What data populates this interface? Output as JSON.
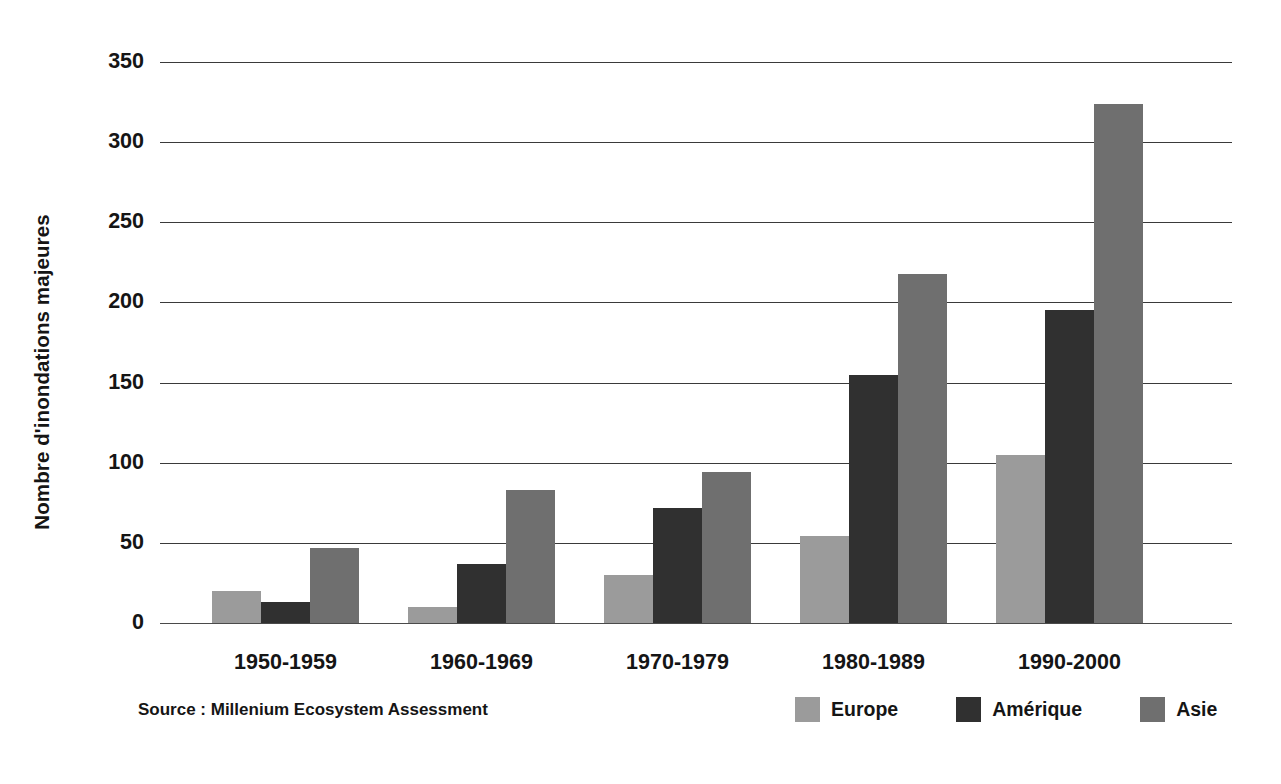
{
  "chart_data": {
    "type": "bar",
    "title": "",
    "subtitle": "",
    "xlabel": "",
    "ylabel": "Nombre d'inondations majeures",
    "ylim": [
      0,
      350
    ],
    "ytick_step": 50,
    "yticks": [
      "350",
      "300",
      "250",
      "200",
      "150",
      "100",
      "50",
      "0"
    ],
    "grid": true,
    "legend_position": "bottom-right",
    "categories": [
      "1950-1959",
      "1960-1969",
      "1970-1979",
      "1980-1989",
      "1990-2000"
    ],
    "series": [
      {
        "name": "Europe",
        "color": "#9b9b9b",
        "values": [
          20,
          10,
          30,
          54,
          105
        ]
      },
      {
        "name": "Amérique",
        "color": "#303030",
        "values": [
          13,
          37,
          72,
          155,
          195
        ]
      },
      {
        "name": "Asie",
        "color": "#6f6f6f",
        "values": [
          47,
          83,
          94,
          218,
          324
        ]
      }
    ],
    "annotations": [
      "Source : Millenium Ecosystem Assessment"
    ]
  },
  "axis": {
    "y_title": "Nombre d'inondations majeures"
  },
  "footer": {
    "source": "Source : Millenium Ecosystem Assessment"
  },
  "colors": {
    "europe": "#9b9b9b",
    "amerique": "#303030",
    "asie": "#6f6f6f",
    "gridline": "#3a3a3a",
    "text": "#151515",
    "background": "#ffffff"
  }
}
